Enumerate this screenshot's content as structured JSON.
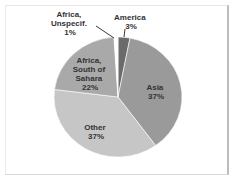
{
  "chart_data": {
    "type": "pie",
    "title": "",
    "categories": [
      "America",
      "Asia",
      "Other",
      "Africa, South of Sahara",
      "Africa, Unspecif."
    ],
    "values": [
      3,
      37,
      37,
      22,
      1
    ],
    "unit": "%",
    "colors": [
      "#6b6b6b",
      "#9a9a9a",
      "#c6c6c6",
      "#a9a9a9",
      "#ffffff"
    ],
    "labels": [
      {
        "lines": [
          "America",
          "3%"
        ]
      },
      {
        "lines": [
          "Asia",
          "37%"
        ]
      },
      {
        "lines": [
          "Other",
          "37%"
        ]
      },
      {
        "lines": [
          "Africa,",
          "South of",
          "Sahara",
          "22%"
        ]
      },
      {
        "lines": [
          "Africa,",
          "Unspecif.",
          "1%"
        ]
      }
    ],
    "start_angle_deg": 0,
    "direction": "clockwise",
    "legend": "none"
  }
}
